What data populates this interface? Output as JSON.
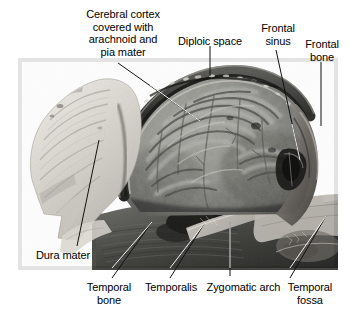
{
  "figure": {
    "type": "anatomical-dissection-photograph",
    "view": "lateral view of cranial cavity with calvaria removed",
    "modality": "grayscale cadaveric photograph",
    "background_color": "#ffffff",
    "photo_bounds": {
      "x": 18,
      "y": 58,
      "width": 320,
      "height": 212
    }
  },
  "labels": {
    "cerebral_cortex": {
      "text": "Cerebral cortex\ncovered with\narachnoid and\npia mater",
      "lines": [
        "Cerebral cortex",
        "covered with",
        "arachnoid and",
        "pia mater"
      ]
    },
    "diploic_space": {
      "text": "Diploic space"
    },
    "frontal_sinus": {
      "text": "Frontal\nsinus",
      "lines": [
        "Frontal",
        "sinus"
      ]
    },
    "frontal_bone": {
      "text": "Frontal\nbone",
      "lines": [
        "Frontal",
        "bone"
      ]
    },
    "dura_mater": {
      "text": "Dura mater"
    },
    "temporal_bone": {
      "text": "Temporal\nbone",
      "lines": [
        "Temporal",
        "bone"
      ]
    },
    "temporalis": {
      "text": "Temporalis"
    },
    "zygomatic_arch": {
      "text": "Zygomatic arch"
    },
    "temporal_fossa": {
      "text": "Temporal\nfossa",
      "lines": [
        "Temporal",
        "fossa"
      ]
    }
  },
  "colors": {
    "text": "#000000",
    "leader_dark": "#1a1a1a",
    "leader_light": "#f2f2f2",
    "background": "#ffffff",
    "bone_pale": "#e6e2dc",
    "brain_mid": "#8a8a86",
    "muscle_dark": "#4a4a48",
    "cavity_shadow": "#262626"
  }
}
